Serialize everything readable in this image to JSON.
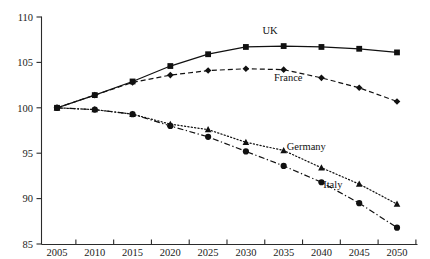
{
  "chart_data": {
    "type": "line",
    "title": "",
    "subtitle": "",
    "xlabel": "",
    "ylabel": "",
    "x": [
      2005,
      2010,
      2015,
      2020,
      2025,
      2030,
      2035,
      2040,
      2045,
      2050
    ],
    "xticklabels": [
      "2005",
      "2010",
      "2015",
      "2020",
      "2025",
      "2030",
      "2035",
      "2040",
      "2045",
      "2050"
    ],
    "yticklabels": [
      "85",
      "90",
      "95",
      "100",
      "105",
      "110"
    ],
    "yticks": [
      85,
      90,
      95,
      100,
      105,
      110
    ],
    "xlim": [
      2005,
      2050
    ],
    "ylim": [
      85,
      110
    ],
    "grid": false,
    "legend_position": "inline-annotations",
    "series": [
      {
        "name": "UK",
        "marker": "square",
        "linestyle": "solid",
        "color": "#111111",
        "values": [
          100.0,
          101.4,
          102.9,
          104.6,
          105.9,
          106.7,
          106.8,
          106.7,
          106.5,
          106.1
        ],
        "label_text": "UK"
      },
      {
        "name": "France",
        "marker": "diamond",
        "linestyle": "dashed",
        "color": "#111111",
        "values": [
          100.0,
          101.4,
          102.8,
          103.6,
          104.1,
          104.3,
          104.2,
          103.3,
          102.2,
          100.7
        ],
        "label_text": "France"
      },
      {
        "name": "Germany",
        "marker": "triangle",
        "linestyle": "dotted",
        "color": "#111111",
        "values": [
          100.0,
          99.8,
          99.3,
          98.2,
          97.6,
          96.2,
          95.3,
          93.4,
          91.6,
          89.4
        ],
        "label_text": "Germany"
      },
      {
        "name": "Italy",
        "marker": "circle",
        "linestyle": "dashdot",
        "color": "#111111",
        "values": [
          100.0,
          99.8,
          99.3,
          98.0,
          96.8,
          95.2,
          93.6,
          91.8,
          89.5,
          86.8
        ],
        "label_text": "Italy"
      }
    ],
    "annotations": [
      {
        "text": "UK",
        "series": "UK",
        "x": 2033.2,
        "y": 108.1
      },
      {
        "text": "France",
        "series": "France",
        "x": 2035.6,
        "y": 102.9
      },
      {
        "text": "Germany",
        "series": "Germany",
        "x": 2038.0,
        "y": 95.4
      },
      {
        "text": "Italy",
        "series": "Italy",
        "x": 2041.5,
        "y": 91.2
      }
    ]
  },
  "colors": {
    "ink": "#111111",
    "axis": "#2b2b2b",
    "background": "#ffffff"
  }
}
